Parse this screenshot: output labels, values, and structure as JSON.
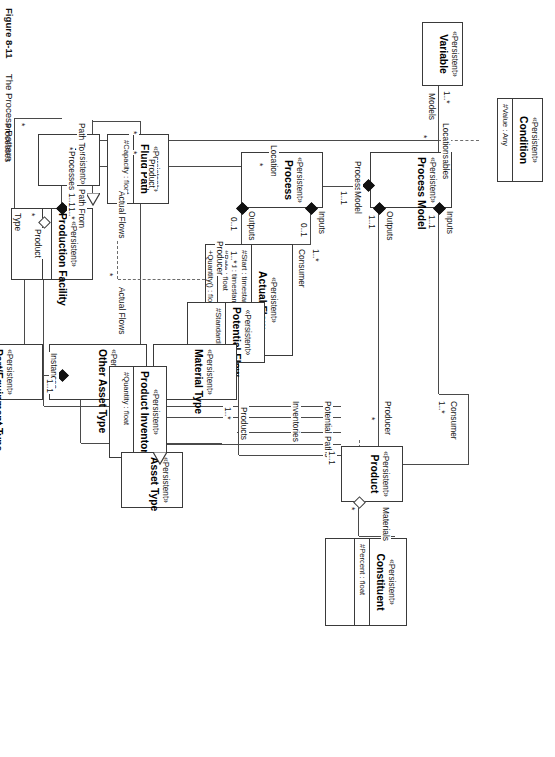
{
  "figure": {
    "number": "Figure 8-11",
    "title": "The Process Pattern"
  },
  "stereotype": "«Persistent»",
  "classes": {
    "condition": {
      "stereotype": "«Persistent»",
      "name": "Condition",
      "attributes": [
        "#Value : Any"
      ]
    },
    "variable": {
      "stereotype": "«Persistent»",
      "name": "Variable",
      "attributes": []
    },
    "process_model": {
      "stereotype": "«Persistent»",
      "name": "Process Model",
      "attributes": []
    },
    "process": {
      "stereotype": "«Persistent»",
      "name": "Process",
      "attributes": []
    },
    "actual_flow": {
      "stereotype": "«Persistent»",
      "name": "Actual Flow",
      "attributes": [
        "#Start : timestamp",
        "#End : timestamp",
        "#Rate : float"
      ],
      "operations": [
        "+Quantity() : float"
      ]
    },
    "potential_flow": {
      "stereotype": "«Persistent»",
      "name": "Potential Flow",
      "attributes": [
        "#StandardRate : float"
      ]
    },
    "product": {
      "stereotype": "«Persistent»",
      "name": "Product",
      "attributes": []
    },
    "constituent": {
      "stereotype": "«Persistent»",
      "name": "Constituent",
      "attributes": [
        "#Percent : float"
      ]
    },
    "material_type": {
      "stereotype": "«Persistent»",
      "name": "Material Type",
      "attributes": []
    },
    "other_asset_type": {
      "stereotype": "«Persistent»",
      "name": "Other Asset Type",
      "attributes": []
    },
    "part_equipment_type": {
      "stereotype": "«Persistent»",
      "name": "Part/Equipment Type",
      "attributes": []
    },
    "asset_type": {
      "stereotype": "«Persistent»",
      "name": "Asset Type",
      "attributes": []
    },
    "fluid_path": {
      "stereotype": "«Persistent»",
      "name": "Fluid Path",
      "attributes": [
        "#Capacity : float"
      ]
    },
    "asset": {
      "stereotype": "«Persistent»",
      "name": "Asset",
      "attributes": []
    },
    "product_inventory": {
      "stereotype": "«Persistent»",
      "name": "Product Inventory",
      "attributes": [
        "#Quantity : float"
      ]
    },
    "production_facility": {
      "stereotype": "«Persistent»",
      "name": "Production Facility",
      "attributes": []
    }
  },
  "labels": {
    "models": "Models",
    "variables": "Variables",
    "locations": "Locations",
    "processes": "Processes",
    "processes2": "Processes",
    "processes3": "Processes",
    "model": "Model",
    "inputs": "Inputs",
    "inputs2": "Inputs",
    "outputs": "Outputs",
    "outputs2": "Outputs",
    "consumer": "Consumer",
    "consumer2": "Consumer",
    "producer": "Producer",
    "producer2": "Producer",
    "materials": "Materials",
    "inventories": "Inventories",
    "potential_paths": "Potential Paths",
    "products": "Products",
    "instances": "Instances",
    "location": "Location",
    "product": "Product",
    "product2": "Product",
    "actual_flows": "Actual Flows",
    "actual_flows2": "Actual Flows",
    "path_to": "Path To",
    "path_from": "Path From",
    "type": "Type"
  },
  "multiplicities": {
    "variable_star": "1..*",
    "locations_star": "*",
    "pm_inputs": "1..1",
    "pm_outputs": "1..1",
    "model_11": "1..1",
    "proc_inputs": "0..1",
    "proc_outputs": "0..1",
    "af_consumer": "1..*",
    "af_producer": "1..*",
    "prod_consumer": "1..*",
    "prod_producer": "*",
    "prod_star": "*",
    "potential_paths": "1..1",
    "materials_star": "*",
    "products_1star": "1..*",
    "instances_11": "1..1",
    "processes_11": "1..1",
    "processes_star": "*",
    "location_star": "*",
    "product_star": "*",
    "fluidpath_star": "*",
    "inv_star": "*",
    "pathto_star": "*",
    "pathfrom_star": "*",
    "pathfrom_1star": "1..*",
    "type_star": "*"
  },
  "colors": {
    "line": "#4a4a4a",
    "box_border": "#3a3a3a",
    "text": "#111111",
    "background": "#ffffff"
  }
}
